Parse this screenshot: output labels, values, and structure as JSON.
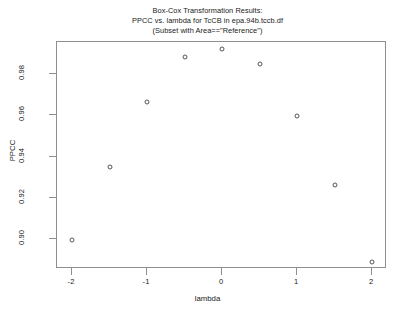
{
  "chart_data": {
    "type": "scatter",
    "title_lines": [
      "Box-Cox Transformation Results:",
      "PPCC vs. lambda for TcCB in epa.94b.tccb.df",
      "(Subset with Area==\"Reference\")"
    ],
    "xlabel": "lambda",
    "ylabel": "PPCC",
    "xlim": [
      -2.2,
      2.2
    ],
    "ylim": [
      0.8855,
      0.9955
    ],
    "xticks": [
      -2,
      -1,
      0,
      1,
      2
    ],
    "xtick_labels": [
      "-2",
      "-1",
      "0",
      "1",
      "2"
    ],
    "yticks": [
      0.9,
      0.92,
      0.94,
      0.96,
      0.98
    ],
    "ytick_labels": [
      "0.90",
      "0.92",
      "0.94",
      "0.96",
      "0.98"
    ],
    "grid": false,
    "legend": false,
    "marker": "open-circle",
    "marker_color": "#555555",
    "x": [
      -2,
      -1.5,
      -1,
      -0.5,
      0,
      0.5,
      1,
      1.5,
      2
    ],
    "y": [
      0.8995,
      0.9347,
      0.9665,
      0.9881,
      0.9921,
      0.9846,
      0.9598,
      0.9261,
      0.8889
    ],
    "points": [
      {
        "x": -2,
        "y": 0.8995
      },
      {
        "x": -1.5,
        "y": 0.9347
      },
      {
        "x": -1,
        "y": 0.9665
      },
      {
        "x": -0.5,
        "y": 0.9881
      },
      {
        "x": 0,
        "y": 0.9921
      },
      {
        "x": 0.5,
        "y": 0.9846
      },
      {
        "x": 1,
        "y": 0.9598
      },
      {
        "x": 1.5,
        "y": 0.9261
      },
      {
        "x": 2,
        "y": 0.8889
      }
    ]
  }
}
